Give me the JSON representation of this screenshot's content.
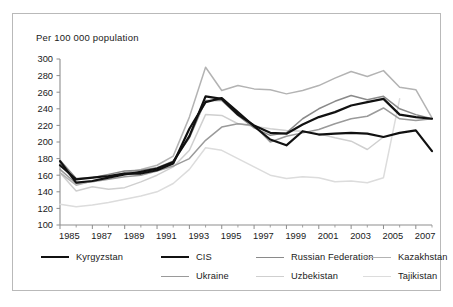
{
  "chart_data": {
    "type": "line",
    "title": "",
    "subtitle": "",
    "xlabel": "",
    "ylabel": "Per 100 000 population",
    "axis_note": "Per 100 000 population",
    "xlim": [
      1985,
      2008
    ],
    "ylim": [
      100,
      300
    ],
    "ytick_step": 20,
    "yticks": [
      100,
      120,
      140,
      160,
      180,
      200,
      220,
      240,
      260,
      280,
      300
    ],
    "xticks": [
      1985,
      1987,
      1989,
      1991,
      1993,
      1995,
      1997,
      1999,
      2001,
      2003,
      2005,
      2007
    ],
    "x": [
      1985,
      1986,
      1987,
      1988,
      1989,
      1990,
      1991,
      1992,
      1993,
      1994,
      1995,
      1996,
      1997,
      1998,
      1999,
      2000,
      2001,
      2002,
      2003,
      2004,
      2005,
      2006,
      2007,
      2008
    ],
    "grid": false,
    "legend_position": "bottom",
    "series": [
      {
        "name": "Kyrgyzstan",
        "color": "#111111",
        "width": 2.2,
        "values": [
          172,
          155,
          157,
          159,
          162,
          162,
          166,
          174,
          216,
          248,
          253,
          236,
          219,
          203,
          196,
          213,
          209,
          210,
          211,
          210,
          206,
          211,
          214,
          189
        ]
      },
      {
        "name": "CIS",
        "color": "#111111",
        "width": 2.2,
        "values": [
          177,
          151,
          153,
          157,
          161,
          164,
          168,
          176,
          207,
          255,
          252,
          233,
          220,
          211,
          210,
          221,
          230,
          236,
          244,
          248,
          252,
          233,
          230,
          228
        ]
      },
      {
        "name": "Russian Federation",
        "color": "#8a8a8a",
        "width": 1.5,
        "values": [
          178,
          156,
          157,
          161,
          165,
          166,
          169,
          177,
          205,
          250,
          250,
          232,
          217,
          208,
          211,
          228,
          240,
          249,
          256,
          251,
          255,
          240,
          233,
          228
        ]
      },
      {
        "name": "Kazakhstan",
        "color": "#b3b3b3",
        "width": 1.5,
        "values": [
          163,
          148,
          153,
          158,
          163,
          167,
          172,
          183,
          230,
          290,
          262,
          268,
          264,
          263,
          258,
          262,
          268,
          277,
          285,
          279,
          286,
          266,
          263,
          229
        ]
      },
      {
        "name": "Ukraine",
        "color": "#9a9a9a",
        "width": 1.5,
        "values": [
          167,
          150,
          152,
          155,
          158,
          160,
          165,
          171,
          180,
          202,
          218,
          222,
          220,
          200,
          207,
          211,
          215,
          222,
          228,
          231,
          241,
          228,
          226,
          228
        ]
      },
      {
        "name": "Uzbekistan",
        "color": "#cfcfcf",
        "width": 1.5,
        "values": [
          163,
          141,
          146,
          143,
          145,
          152,
          160,
          170,
          190,
          233,
          232,
          222,
          219,
          216,
          214,
          213,
          210,
          205,
          201,
          191,
          206,
          null,
          null,
          null
        ]
      },
      {
        "name": "Tajikistan",
        "color": "#dcdcdc",
        "width": 1.5,
        "values": [
          125,
          122,
          124,
          127,
          131,
          135,
          140,
          150,
          167,
          193,
          190,
          180,
          170,
          160,
          156,
          158,
          157,
          152,
          153,
          151,
          157,
          252,
          null,
          null
        ]
      }
    ]
  },
  "legend": {
    "row1": [
      {
        "label": "Kyrgyzstan",
        "color": "#111111",
        "width": 2.2
      },
      {
        "label": "CIS",
        "color": "#111111",
        "width": 2.2
      },
      {
        "label": "Russian Federation",
        "color": "#8a8a8a",
        "width": 1.5
      },
      {
        "label": "Kazakhstan",
        "color": "#b3b3b3",
        "width": 1.5
      }
    ],
    "row2": [
      {
        "label": "Ukraine",
        "color": "#9a9a9a",
        "width": 1.5
      },
      {
        "label": "Uzbekistan",
        "color": "#cfcfcf",
        "width": 1.5
      },
      {
        "label": "Tajikistan",
        "color": "#dcdcdc",
        "width": 1.5
      }
    ]
  },
  "style": {
    "axis_color": "#8d8d8d",
    "frame_color": "#b9b9b9",
    "text_color": "#1a1a1a"
  }
}
